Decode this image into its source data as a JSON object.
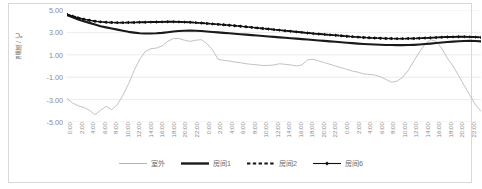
{
  "chart_data": {
    "type": "line",
    "title": "",
    "xlabel": "",
    "ylabel": "温度 / ℃",
    "ylim": [
      -5.0,
      5.0
    ],
    "ytick_labels": [
      "5.00",
      "3.00",
      "1.00",
      "-1.00",
      "-3.00",
      "-5.00"
    ],
    "ytick_values": [
      5.0,
      3.0,
      1.0,
      -1.0,
      -3.0,
      -5.0
    ],
    "grid": "horizontal",
    "legend_position": "bottom",
    "x_tick_labels": [
      "0:00",
      "2:00",
      "4:00",
      "6:00",
      "8:00",
      "10:00",
      "12:00",
      "14:00",
      "16:00",
      "18:00",
      "20:00",
      "22:00",
      "0:00",
      "2:00",
      "4:00",
      "6:00",
      "8:00",
      "10:00",
      "12:00",
      "14:00",
      "16:00",
      "18:00",
      "20:00",
      "22:00",
      "0:00",
      "2:00",
      "4:00",
      "6:00",
      "8:00",
      "10:00",
      "12:00",
      "14:00",
      "16:00",
      "18:00",
      "20:00",
      "22:00"
    ],
    "series": [
      {
        "name": "室外",
        "style": "thin-solid",
        "color": "#b3b3b3",
        "values": [
          -2.9,
          -3.3,
          -3.55,
          -3.7,
          -3.95,
          -4.35,
          -3.95,
          -3.6,
          -3.9,
          -3.45,
          -2.6,
          -1.6,
          -0.4,
          0.6,
          1.3,
          1.55,
          1.6,
          1.8,
          2.2,
          2.45,
          2.45,
          2.3,
          2.2,
          2.3,
          2.35,
          2.0,
          1.45,
          0.6,
          0.5,
          0.45,
          0.35,
          0.3,
          0.2,
          0.15,
          0.1,
          0.05,
          0.05,
          0.1,
          0.2,
          0.15,
          0.1,
          0.0,
          0.1,
          0.55,
          0.6,
          0.45,
          0.3,
          0.15,
          0.0,
          -0.15,
          -0.3,
          -0.45,
          -0.55,
          -0.7,
          -0.75,
          -0.8,
          -0.95,
          -1.2,
          -1.45,
          -1.35,
          -1.0,
          -0.4,
          0.45,
          1.25,
          1.95,
          2.35,
          2.2,
          1.55,
          0.7,
          0.0,
          -0.85,
          -1.75,
          -2.6,
          -3.45,
          -4.05
        ]
      },
      {
        "name": "房间1",
        "style": "thick-solid",
        "color": "#1a1a1a",
        "values": [
          4.55,
          4.35,
          4.15,
          4.0,
          3.85,
          3.7,
          3.55,
          3.45,
          3.35,
          3.25,
          3.15,
          3.05,
          2.98,
          2.92,
          2.9,
          2.9,
          2.92,
          2.96,
          3.02,
          3.08,
          3.12,
          3.15,
          3.16,
          3.15,
          3.12,
          3.08,
          3.04,
          3.0,
          2.96,
          2.92,
          2.88,
          2.84,
          2.8,
          2.76,
          2.72,
          2.68,
          2.64,
          2.6,
          2.56,
          2.52,
          2.48,
          2.44,
          2.4,
          2.36,
          2.32,
          2.28,
          2.24,
          2.2,
          2.16,
          2.12,
          2.08,
          2.04,
          2.0,
          1.97,
          1.94,
          1.92,
          1.9,
          1.88,
          1.87,
          1.86,
          1.86,
          1.87,
          1.89,
          1.92,
          1.96,
          2.0,
          2.05,
          2.1,
          2.14,
          2.18,
          2.21,
          2.23,
          2.24,
          2.23,
          2.2
        ]
      },
      {
        "name": "房间2",
        "style": "dashed",
        "color": "#111111",
        "values": [
          4.6,
          4.45,
          4.3,
          4.18,
          4.08,
          4.0,
          3.94,
          3.9,
          3.88,
          3.87,
          3.87,
          3.88,
          3.89,
          3.9,
          3.91,
          3.92,
          3.93,
          3.94,
          3.95,
          3.95,
          3.94,
          3.92,
          3.9,
          3.87,
          3.84,
          3.8,
          3.76,
          3.72,
          3.68,
          3.64,
          3.6,
          3.55,
          3.5,
          3.45,
          3.4,
          3.35,
          3.3,
          3.25,
          3.2,
          3.15,
          3.1,
          3.05,
          3.0,
          2.95,
          2.9,
          2.86,
          2.82,
          2.78,
          2.74,
          2.7,
          2.66,
          2.62,
          2.58,
          2.55,
          2.52,
          2.5,
          2.48,
          2.46,
          2.45,
          2.44,
          2.44,
          2.45,
          2.46,
          2.48,
          2.5,
          2.52,
          2.55,
          2.57,
          2.59,
          2.6,
          2.61,
          2.61,
          2.6,
          2.58,
          2.55
        ]
      },
      {
        "name": "房间6",
        "style": "marker-diamond",
        "color": "#111111",
        "values": [
          4.6,
          4.45,
          4.3,
          4.18,
          4.08,
          4.0,
          3.94,
          3.9,
          3.88,
          3.87,
          3.87,
          3.88,
          3.89,
          3.9,
          3.91,
          3.92,
          3.93,
          3.94,
          3.95,
          3.95,
          3.94,
          3.92,
          3.9,
          3.87,
          3.84,
          3.8,
          3.76,
          3.72,
          3.68,
          3.64,
          3.6,
          3.55,
          3.5,
          3.45,
          3.4,
          3.35,
          3.3,
          3.25,
          3.2,
          3.15,
          3.1,
          3.05,
          3.0,
          2.95,
          2.9,
          2.86,
          2.82,
          2.78,
          2.74,
          2.7,
          2.66,
          2.62,
          2.58,
          2.55,
          2.52,
          2.5,
          2.48,
          2.46,
          2.45,
          2.44,
          2.44,
          2.45,
          2.46,
          2.48,
          2.5,
          2.52,
          2.55,
          2.57,
          2.59,
          2.6,
          2.61,
          2.61,
          2.6,
          2.58,
          2.55
        ]
      }
    ]
  },
  "caption": ""
}
